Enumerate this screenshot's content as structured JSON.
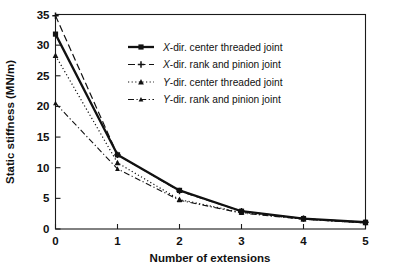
{
  "chart_data": {
    "type": "line",
    "title": "",
    "xlabel": "Number of extensions",
    "ylabel": "Static stiffness (MN/m)",
    "x": [
      0,
      1,
      2,
      3,
      4,
      5
    ],
    "xlim": [
      0,
      5
    ],
    "ylim": [
      0,
      35
    ],
    "xticks": [
      "0",
      "1",
      "2",
      "3",
      "4",
      "5"
    ],
    "yticks": [
      "0",
      "5",
      "10",
      "15",
      "20",
      "25",
      "30",
      "35"
    ],
    "grid": false,
    "legend_position": "upper-center-right",
    "series": [
      {
        "name": "X-dir. center threaded joint",
        "name_italic_prefix": "X",
        "name_rest": "-dir. center threaded joint",
        "values": [
          31.8,
          12.1,
          6.3,
          2.9,
          1.7,
          1.1
        ],
        "style": "solid-thick",
        "marker": "square",
        "color": "#111111"
      },
      {
        "name": "X-dir. rank and pinion joint",
        "name_italic_prefix": "X",
        "name_rest": "-dir. rank and pinion joint",
        "values": [
          34.8,
          12.1,
          6.2,
          2.9,
          1.7,
          1.1
        ],
        "style": "dashed-long",
        "marker": "plus",
        "color": "#111111"
      },
      {
        "name": "Y-dir. center threaded joint",
        "name_italic_prefix": "Y",
        "name_rest": "-dir. center threaded joint",
        "values": [
          28.3,
          10.8,
          4.8,
          2.7,
          1.6,
          1.0
        ],
        "style": "dotted",
        "marker": "triangle",
        "color": "#111111"
      },
      {
        "name": "Y-dir. rank and pinion joint",
        "name_italic_prefix": "Y",
        "name_rest": "-dir. rank and pinion joint",
        "values": [
          20.5,
          9.8,
          4.7,
          2.6,
          1.6,
          1.0
        ],
        "style": "dash-dot",
        "marker": "triangle-small",
        "color": "#111111"
      }
    ]
  },
  "axes": {
    "x_title": "Number of extensions",
    "y_title": "Static stiffness (MN/m)",
    "x_tick_labels": [
      "0",
      "1",
      "2",
      "3",
      "4",
      "5"
    ],
    "y_tick_labels": [
      "0",
      "5",
      "10",
      "15",
      "20",
      "25",
      "30",
      "35"
    ]
  },
  "legend": {
    "items": [
      {
        "label": "X-dir. center threaded joint",
        "italic": "X",
        "rest": "-dir. center threaded joint"
      },
      {
        "label": "X-dir. rank and pinion joint",
        "italic": "X",
        "rest": "-dir. rank and pinion joint"
      },
      {
        "label": "Y-dir. center threaded joint",
        "italic": "Y",
        "rest": "-dir. center threaded joint"
      },
      {
        "label": "Y-dir. rank and pinion joint",
        "italic": "Y",
        "rest": "-dir. rank and pinion joint"
      }
    ]
  },
  "colors": {
    "ink": "#111111",
    "frame": "#1a1a1a",
    "background": "#ffffff"
  }
}
